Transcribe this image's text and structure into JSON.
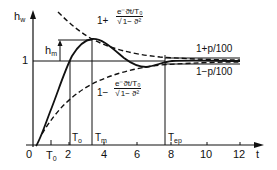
{
  "diagram": {
    "y_axis_label": "hw",
    "y_axis_label_main": "h",
    "y_axis_label_sub": "w",
    "x_axis_label": "t",
    "y_tick_one": "1",
    "x_ticks": [
      "0",
      "2",
      "4",
      "6",
      "8",
      "10",
      "12"
    ],
    "peak_label_main": "h",
    "peak_label_sub": "m",
    "markers": {
      "T0_main": "T",
      "T0_sub": "0",
      "To_main": "T",
      "To_sub": "o",
      "Tm_main": "T",
      "Tm_sub": "m",
      "Tep_main": "T",
      "Tep_sub": "ep"
    },
    "upper_envelope": {
      "prefix": "1+",
      "numerator": "e⁻ϑt/T₀",
      "denominator_root": "√",
      "denominator": "1− ϑ²"
    },
    "lower_envelope": {
      "prefix": "1−",
      "numerator": "e⁻ϑt/T₀",
      "denominator_root": "√",
      "denominator": "1− ϑ²"
    },
    "band_upper_label": "1+p/100",
    "band_lower_label": "1−p/100",
    "colors": {
      "ink": "#111111",
      "background": "#ffffff"
    }
  }
}
